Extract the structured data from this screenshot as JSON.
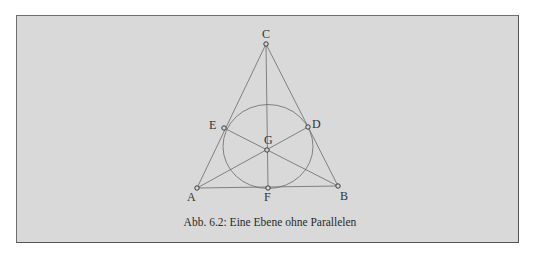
{
  "figure": {
    "caption": "Abb. 6.2: Eine Ebene ohne Parallelen",
    "background_color": "#d9d9d9",
    "line_color": "#6a6a6a"
  },
  "points": [
    {
      "label": "A",
      "x": 197,
      "y": 188
    },
    {
      "label": "B",
      "x": 338,
      "y": 186
    },
    {
      "label": "C",
      "x": 266,
      "y": 44
    },
    {
      "label": "D",
      "x": 308,
      "y": 127
    },
    {
      "label": "E",
      "x": 224,
      "y": 128
    },
    {
      "label": "F",
      "x": 268,
      "y": 188
    },
    {
      "label": "G",
      "x": 267,
      "y": 150
    }
  ],
  "labels": {
    "A": "A",
    "B": "B",
    "C": "C",
    "D": "D",
    "E": "E",
    "F": "F",
    "G": "G"
  },
  "lines": [
    [
      "A",
      "B"
    ],
    [
      "B",
      "C"
    ],
    [
      "C",
      "A"
    ],
    [
      "A",
      "D"
    ],
    [
      "B",
      "E"
    ],
    [
      "C",
      "F"
    ]
  ],
  "circle": {
    "through": [
      "D",
      "E",
      "F"
    ],
    "cx": 268,
    "cy": 146,
    "r": 43
  }
}
